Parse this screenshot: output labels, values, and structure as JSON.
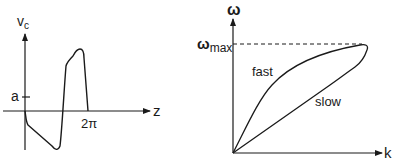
{
  "left_plot": {
    "y_axis_label": "v",
    "y_axis_subscript": "c",
    "x_axis_label": "z",
    "y_tick_label": "a",
    "x_tick_label": "2π"
  },
  "right_plot": {
    "y_axis_label": "ω",
    "x_axis_label": "k",
    "max_label_symbol": "ω",
    "max_label_subscript": "max",
    "upper_branch_label": "fast",
    "lower_branch_label": "slow"
  },
  "colors": {
    "ink": "#1a1a1a",
    "background": "#ffffff"
  }
}
